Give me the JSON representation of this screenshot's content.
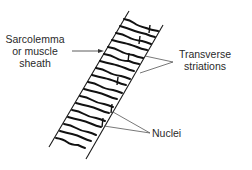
{
  "diagram": {
    "colors": {
      "ink": "#1a1a1a",
      "text": "#2a2a2a",
      "leader": "#555555",
      "background": "#ffffff"
    },
    "labels": {
      "sarcolemma": {
        "line1": "Sarcolemma",
        "line2": "or muscle",
        "line3": "sheath"
      },
      "transverse": {
        "line1": "Transverse",
        "line2": "striations"
      },
      "nuclei": {
        "text": "Nuclei"
      }
    }
  }
}
